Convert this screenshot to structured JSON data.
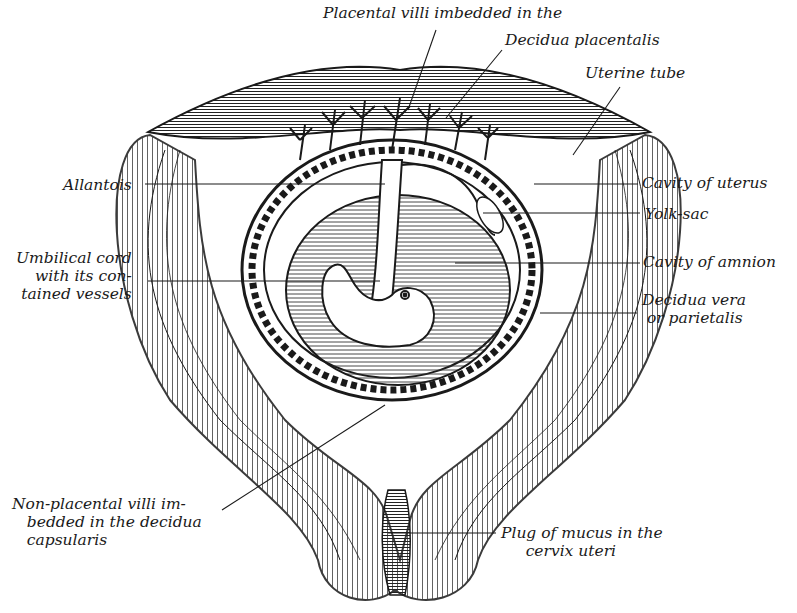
{
  "figure": {
    "colors": {
      "ink": "#1a1a1a",
      "paper": "#ffffff",
      "hatch": "#333333"
    }
  },
  "labels": {
    "placental_villi_line1": "Placental villi imbedded in the",
    "placental_villi_line2": "Decidua placentalis",
    "uterine_tube": "Uterine tube",
    "allantois": "Allantois",
    "cavity_of_uterus": "Cavity of uterus",
    "yolk_sac": "Yolk-sac",
    "umbilical_cord": "Umbilical cord\nwith its con-\ntained vessels",
    "cavity_of_amnion": "Cavity of amnion",
    "decidua_vera": "Decidua vera\n or parietalis",
    "non_placental_villi": "Non-placental villi im-\n   bedded in the decidua\n   capsularis",
    "plug_of_mucus": "Plug of mucus in the\n     cervix uteri"
  }
}
